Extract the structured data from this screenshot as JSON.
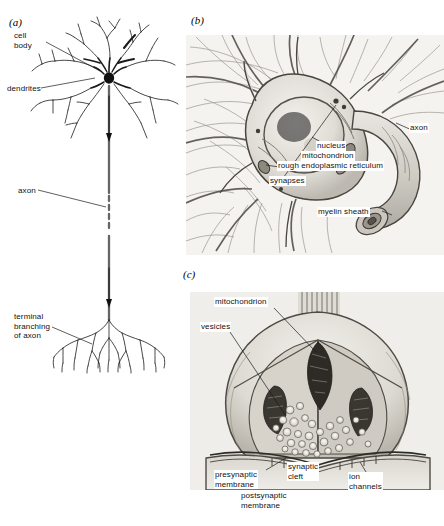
{
  "figure": {
    "background_color": "#ffffff",
    "ink_color": "#1a1a1a"
  },
  "panels": {
    "a": {
      "letter": "(a)",
      "caption": "Line drawing of a complete neuron",
      "labels": {
        "cell_body": "cell\nbody",
        "dendrites": "dendrites",
        "axon": "axon",
        "terminal_branching": "terminal\nbranching\nof axon"
      }
    },
    "b": {
      "letter": "(b)",
      "caption": "Shaded drawing of the neuron cell body with surrounding processes",
      "labels": {
        "nucleus": "nucleus",
        "mitochondrion": "mitochondrion",
        "rough_er": "rough endoplasmic reticulum",
        "synapses": "synapses",
        "myelin_sheath": "myelin sheath",
        "axon": "axon"
      }
    },
    "c": {
      "letter": "(c)",
      "caption": "Shaded drawing of a synapse in cross-section",
      "labels": {
        "mitochondrion": "mitochondrion",
        "vesicles": "vesicles",
        "presynaptic_membrane": "presynaptic\nmembrane",
        "synaptic_cleft": "synaptic\ncleft",
        "postsynaptic_membrane": "postsynaptic\nmembrane",
        "ion_channels": "ion\nchannels"
      }
    }
  }
}
